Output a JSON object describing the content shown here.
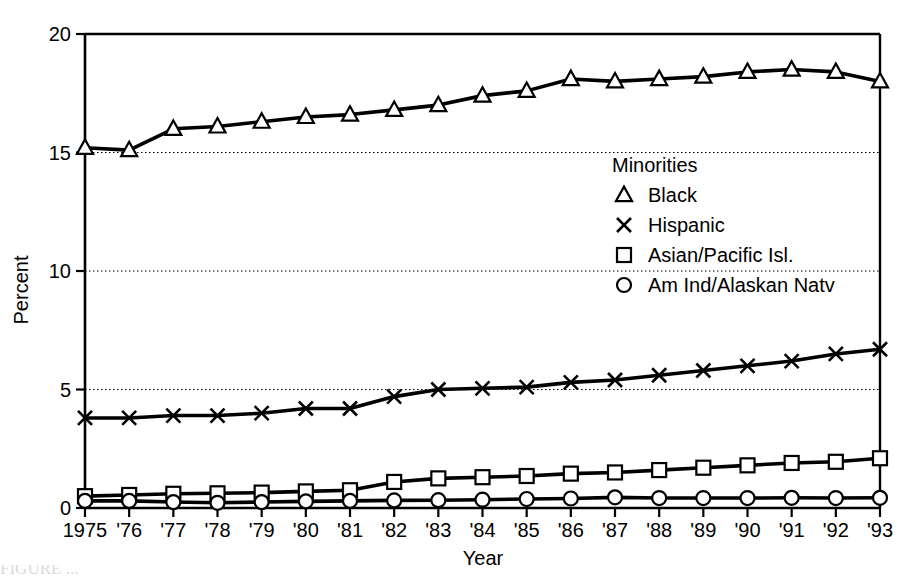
{
  "figure": {
    "background_color": "#ffffff",
    "ink_color": "#000000",
    "caption_fragment": "FIGURE  ..."
  },
  "axes": {
    "x_axis_title": "Year",
    "y_axis_title": "Percent",
    "y_ticks": [
      "0",
      "5",
      "10",
      "15",
      "20"
    ],
    "x_ticks": [
      "1975",
      "'76",
      "'77",
      "'78",
      "'79",
      "'80",
      "'81",
      "'82",
      "'83",
      "'84",
      "'85",
      "'86",
      "'87",
      "'88",
      "'89",
      "'90",
      "'91",
      "'92",
      "'93"
    ]
  },
  "legend": {
    "title": "Minorities",
    "entries": [
      {
        "label": "Black",
        "marker": "triangle"
      },
      {
        "label": "Hispanic",
        "marker": "cross"
      },
      {
        "label": "Asian/Pacific Isl.",
        "marker": "square"
      },
      {
        "label": "Am Ind/Alaskan Natv",
        "marker": "circle"
      }
    ]
  },
  "chart_data": {
    "type": "line",
    "title": "",
    "xlabel": "Year",
    "ylabel": "Percent",
    "xlim": [
      1975,
      1993
    ],
    "ylim": [
      0,
      20
    ],
    "yticks": [
      0,
      5,
      10,
      15,
      20
    ],
    "grid": "horizontal-dotted",
    "legend_position": "inside-right-upper",
    "legend_title": "Minorities",
    "x": [
      1975,
      1976,
      1977,
      1978,
      1979,
      1980,
      1981,
      1982,
      1983,
      1984,
      1985,
      1986,
      1987,
      1988,
      1989,
      1990,
      1991,
      1992,
      1993
    ],
    "categories": [
      "1975",
      "'76",
      "'77",
      "'78",
      "'79",
      "'80",
      "'81",
      "'82",
      "'83",
      "'84",
      "'85",
      "'86",
      "'87",
      "'88",
      "'89",
      "'90",
      "'91",
      "'92",
      "'93"
    ],
    "series": [
      {
        "name": "Black",
        "marker": "triangle",
        "values": [
          15.2,
          15.1,
          16.0,
          16.1,
          16.3,
          16.5,
          16.6,
          16.8,
          17.0,
          17.4,
          17.6,
          18.1,
          18.0,
          18.1,
          18.2,
          18.4,
          18.5,
          18.4,
          18.0
        ]
      },
      {
        "name": "Hispanic",
        "marker": "cross",
        "values": [
          3.8,
          3.8,
          3.9,
          3.9,
          4.0,
          4.2,
          4.2,
          4.7,
          5.0,
          5.05,
          5.1,
          5.3,
          5.4,
          5.6,
          5.8,
          6.0,
          6.2,
          6.5,
          6.7
        ]
      },
      {
        "name": "Asian/Pacific Isl.",
        "marker": "square",
        "values": [
          0.5,
          0.55,
          0.6,
          0.62,
          0.65,
          0.7,
          0.75,
          1.1,
          1.25,
          1.3,
          1.35,
          1.45,
          1.5,
          1.6,
          1.7,
          1.8,
          1.9,
          1.95,
          2.1
        ]
      },
      {
        "name": "Am Ind/Alaskan Natv",
        "marker": "circle",
        "values": [
          0.3,
          0.3,
          0.25,
          0.22,
          0.25,
          0.28,
          0.3,
          0.32,
          0.33,
          0.35,
          0.38,
          0.4,
          0.45,
          0.42,
          0.42,
          0.42,
          0.43,
          0.42,
          0.43
        ]
      }
    ]
  }
}
